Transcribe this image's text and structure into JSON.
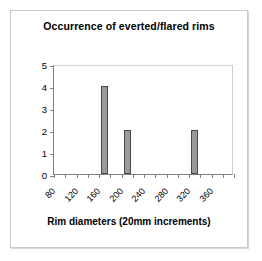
{
  "chart_data": {
    "type": "bar",
    "title": "Occurrence of everted/flared rims",
    "xlabel": "Rim diameters (20mm increments)",
    "ylabel": "",
    "categories": [
      80,
      100,
      120,
      140,
      160,
      180,
      200,
      220,
      240,
      260,
      280,
      300,
      320,
      340,
      360,
      380
    ],
    "values": [
      0,
      0,
      0,
      0,
      4,
      0,
      2,
      0,
      0,
      0,
      0,
      0,
      2,
      0,
      0,
      0
    ],
    "series": [
      {
        "name": "Occurrence",
        "values": [
          0,
          0,
          0,
          0,
          4,
          0,
          2,
          0,
          0,
          0,
          0,
          0,
          2,
          0,
          0,
          0
        ]
      }
    ],
    "xtick_labels": [
      "80",
      "120",
      "160",
      "200",
      "240",
      "280",
      "320",
      "360"
    ],
    "xtick_label_indices": [
      0,
      2,
      4,
      6,
      8,
      10,
      12,
      14
    ],
    "xtick_label_rotation": -45,
    "ytick_labels": [
      "0",
      "1",
      "2",
      "3",
      "4",
      "5"
    ],
    "ytick_values": [
      0,
      1,
      2,
      3,
      4,
      5
    ],
    "ylim": [
      0,
      5
    ],
    "grid": false,
    "legend": "none",
    "bar_color": "#9a9a9a",
    "bar_edge_color": "#4a4a4a",
    "axis_color": "#808080",
    "background_color": "#ffffff",
    "frame_color": "#c9c9c9"
  }
}
